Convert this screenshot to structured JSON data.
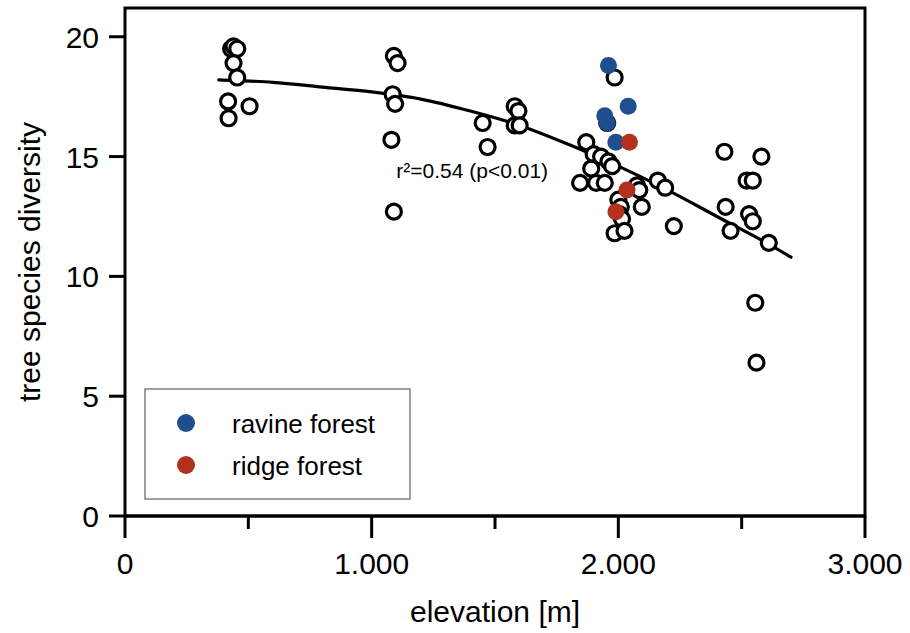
{
  "chart_data": {
    "type": "scatter",
    "title": "",
    "xlabel": "elevation [m]",
    "ylabel": "tree species diversity",
    "xlim": [
      0,
      3000
    ],
    "ylim": [
      0,
      21.2
    ],
    "xticks": [
      0,
      1000,
      2000,
      3000
    ],
    "xtick_labels": [
      "0",
      "1.000",
      "2.000",
      "3.000"
    ],
    "xminor_ticks": [
      500,
      1500,
      2500
    ],
    "yticks": [
      0,
      5,
      10,
      15,
      20
    ],
    "ytick_labels": [
      "0",
      "5",
      "10",
      "15",
      "20"
    ],
    "grid": false,
    "legend_position": "bottom-left",
    "annotation": "r²=0.54 (p<0.01)",
    "annotation_x": 1100,
    "annotation_y": 14.1,
    "series": [
      {
        "name": "other plots",
        "marker": "open-circle",
        "color": "#000000",
        "fill": "#ffffff",
        "points": [
          [
            430,
            19.5
          ],
          [
            440,
            19.6
          ],
          [
            455,
            19.5
          ],
          [
            440,
            18.9
          ],
          [
            455,
            18.3
          ],
          [
            418,
            17.3
          ],
          [
            505,
            17.1
          ],
          [
            420,
            16.6
          ],
          [
            1090,
            19.2
          ],
          [
            1105,
            18.9
          ],
          [
            1085,
            17.6
          ],
          [
            1095,
            17.2
          ],
          [
            1080,
            15.7
          ],
          [
            1090,
            12.7
          ],
          [
            1450,
            16.4
          ],
          [
            1470,
            15.4
          ],
          [
            1580,
            17.1
          ],
          [
            1595,
            16.9
          ],
          [
            1580,
            16.3
          ],
          [
            1600,
            16.3
          ],
          [
            1870,
            15.6
          ],
          [
            1900,
            15.1
          ],
          [
            1930,
            15.0
          ],
          [
            1890,
            14.5
          ],
          [
            1845,
            13.9
          ],
          [
            1910,
            13.9
          ],
          [
            1945,
            13.9
          ],
          [
            1955,
            16.4
          ],
          [
            1985,
            18.3
          ],
          [
            1960,
            14.8
          ],
          [
            1975,
            14.6
          ],
          [
            2000,
            13.2
          ],
          [
            2010,
            12.9
          ],
          [
            2005,
            12.6
          ],
          [
            2015,
            12.4
          ],
          [
            1985,
            11.8
          ],
          [
            2025,
            11.9
          ],
          [
            2075,
            13.8
          ],
          [
            2085,
            13.6
          ],
          [
            2095,
            12.9
          ],
          [
            2160,
            14.0
          ],
          [
            2190,
            13.7
          ],
          [
            2225,
            12.1
          ],
          [
            2430,
            15.2
          ],
          [
            2435,
            12.9
          ],
          [
            2455,
            11.9
          ],
          [
            2520,
            14.0
          ],
          [
            2545,
            14.0
          ],
          [
            2530,
            12.6
          ],
          [
            2545,
            12.3
          ],
          [
            2580,
            15.0
          ],
          [
            2610,
            11.4
          ],
          [
            2555,
            8.9
          ],
          [
            2560,
            6.4
          ]
        ]
      },
      {
        "name": "ravine forest",
        "marker": "filled-circle",
        "color": "#1F4E8C",
        "points": [
          [
            1960,
            18.8
          ],
          [
            2040,
            17.1
          ],
          [
            1945,
            16.7
          ],
          [
            1955,
            16.4
          ],
          [
            1990,
            15.6
          ]
        ]
      },
      {
        "name": "ridge forest",
        "marker": "filled-circle",
        "color": "#B3301E",
        "points": [
          [
            2045,
            15.6
          ],
          [
            2035,
            13.6
          ],
          [
            1990,
            12.7
          ]
        ]
      }
    ],
    "fit_curve": {
      "label": "quadratic regression",
      "color": "#000000",
      "points": [
        [
          380,
          18.2
        ],
        [
          600,
          18.1
        ],
        [
          800,
          17.9
        ],
        [
          1000,
          17.7
        ],
        [
          1200,
          17.4
        ],
        [
          1400,
          16.9
        ],
        [
          1600,
          16.3
        ],
        [
          1800,
          15.5
        ],
        [
          2000,
          14.6
        ],
        [
          2200,
          13.6
        ],
        [
          2400,
          12.5
        ],
        [
          2600,
          11.4
        ],
        [
          2700,
          10.8
        ]
      ]
    }
  },
  "axes": {
    "x_title": "elevation [m]",
    "y_title": "tree species diversity",
    "x_labels": [
      "0",
      "1.000",
      "2.000",
      "3.000"
    ],
    "y_labels": [
      "0",
      "5",
      "10",
      "15",
      "20"
    ]
  },
  "annotation": {
    "text": "r²=0.54 (p<0.01)"
  },
  "legend": {
    "items": [
      {
        "label": "ravine forest",
        "color": "#1F4E8C"
      },
      {
        "label": "ridge forest",
        "color": "#B3301E"
      }
    ]
  }
}
